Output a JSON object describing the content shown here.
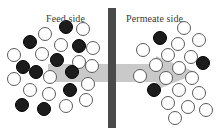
{
  "figure": {
    "width": 224,
    "height": 135,
    "background": "#ffffff"
  },
  "labels": {
    "feed": "Feed side",
    "permeate": "Permeate side"
  },
  "membrane": {
    "name": "membrane-barrier",
    "color": "#4a4a4a",
    "x": 108,
    "y": 8,
    "width": 8,
    "height": 120
  },
  "arrow": {
    "name": "flow-arrow",
    "color": "#c9c9c9",
    "direction": "right",
    "x": 48,
    "y": 56,
    "width": 150,
    "height": 34,
    "shaft_top": 8,
    "shaft_bottom": 26,
    "head_start": 108
  },
  "legend": {
    "filled_color": "#1c1c1c",
    "hollow_color": "#ffffff",
    "hollow_stroke": "#5a5a5a"
  },
  "particles": {
    "feed": [
      {
        "x": 66,
        "y": 27,
        "r": 7,
        "type": "filled"
      },
      {
        "x": 45,
        "y": 34,
        "r": 7,
        "type": "hollow"
      },
      {
        "x": 83,
        "y": 29,
        "r": 7,
        "type": "hollow"
      },
      {
        "x": 30,
        "y": 42,
        "r": 7,
        "type": "filled"
      },
      {
        "x": 61,
        "y": 45,
        "r": 7,
        "type": "hollow"
      },
      {
        "x": 79,
        "y": 46,
        "r": 7,
        "type": "filled"
      },
      {
        "x": 14,
        "y": 55,
        "r": 7,
        "type": "hollow"
      },
      {
        "x": 42,
        "y": 54,
        "r": 7,
        "type": "hollow"
      },
      {
        "x": 23,
        "y": 67,
        "r": 7,
        "type": "filled"
      },
      {
        "x": 57,
        "y": 60,
        "r": 7,
        "type": "filled"
      },
      {
        "x": 79,
        "y": 62,
        "r": 7,
        "type": "hollow"
      },
      {
        "x": 93,
        "y": 48,
        "r": 7,
        "type": "hollow"
      },
      {
        "x": 36,
        "y": 72,
        "r": 7,
        "type": "filled"
      },
      {
        "x": 14,
        "y": 79,
        "r": 7,
        "type": "hollow"
      },
      {
        "x": 50,
        "y": 77,
        "r": 7,
        "type": "hollow"
      },
      {
        "x": 72,
        "y": 72,
        "r": 7,
        "type": "filled"
      },
      {
        "x": 92,
        "y": 66,
        "r": 7,
        "type": "hollow"
      },
      {
        "x": 30,
        "y": 90,
        "r": 7,
        "type": "hollow"
      },
      {
        "x": 49,
        "y": 94,
        "r": 7,
        "type": "hollow"
      },
      {
        "x": 70,
        "y": 90,
        "r": 7,
        "type": "filled"
      },
      {
        "x": 88,
        "y": 84,
        "r": 7,
        "type": "hollow"
      },
      {
        "x": 22,
        "y": 105,
        "r": 7,
        "type": "filled"
      },
      {
        "x": 44,
        "y": 109,
        "r": 7,
        "type": "filled"
      },
      {
        "x": 66,
        "y": 106,
        "r": 7,
        "type": "hollow"
      },
      {
        "x": 86,
        "y": 100,
        "r": 7,
        "type": "hollow"
      }
    ],
    "permeate": [
      {
        "x": 184,
        "y": 28,
        "r": 7,
        "type": "hollow"
      },
      {
        "x": 160,
        "y": 38,
        "r": 7,
        "type": "filled"
      },
      {
        "x": 178,
        "y": 44,
        "r": 7,
        "type": "hollow"
      },
      {
        "x": 199,
        "y": 40,
        "r": 7,
        "type": "hollow"
      },
      {
        "x": 143,
        "y": 50,
        "r": 7,
        "type": "hollow"
      },
      {
        "x": 168,
        "y": 55,
        "r": 7,
        "type": "hollow"
      },
      {
        "x": 191,
        "y": 57,
        "r": 7,
        "type": "hollow"
      },
      {
        "x": 156,
        "y": 65,
        "r": 7,
        "type": "hollow"
      },
      {
        "x": 179,
        "y": 68,
        "r": 7,
        "type": "hollow"
      },
      {
        "x": 203,
        "y": 63,
        "r": 7,
        "type": "filled"
      },
      {
        "x": 140,
        "y": 76,
        "r": 7,
        "type": "hollow"
      },
      {
        "x": 166,
        "y": 78,
        "r": 7,
        "type": "hollow"
      },
      {
        "x": 192,
        "y": 78,
        "r": 7,
        "type": "hollow"
      },
      {
        "x": 154,
        "y": 90,
        "r": 7,
        "type": "filled"
      },
      {
        "x": 179,
        "y": 90,
        "r": 7,
        "type": "hollow"
      },
      {
        "x": 199,
        "y": 93,
        "r": 7,
        "type": "hollow"
      },
      {
        "x": 168,
        "y": 103,
        "r": 7,
        "type": "hollow"
      },
      {
        "x": 188,
        "y": 107,
        "r": 7,
        "type": "hollow"
      },
      {
        "x": 206,
        "y": 110,
        "r": 7,
        "type": "hollow"
      },
      {
        "x": 175,
        "y": 118,
        "r": 7,
        "type": "hollow"
      }
    ]
  }
}
